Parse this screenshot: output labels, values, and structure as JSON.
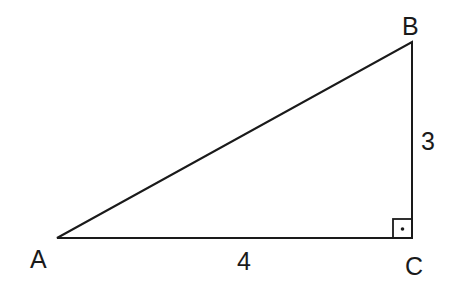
{
  "diagram": {
    "type": "right-triangle",
    "vertices": {
      "A": {
        "label": "A",
        "x": 57,
        "y": 238
      },
      "B": {
        "label": "B",
        "x": 412,
        "y": 42
      },
      "C": {
        "label": "C",
        "x": 412,
        "y": 238
      }
    },
    "sides": {
      "AC": {
        "label": "4"
      },
      "BC": {
        "label": "3"
      }
    },
    "right_angle_at": "C",
    "line_color": "#1a1a1a"
  }
}
